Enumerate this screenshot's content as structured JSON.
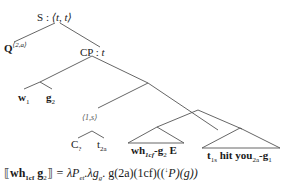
{
  "tree": {
    "root": {
      "cat": "S",
      "type": "⟨t, t⟩"
    },
    "q_node": {
      "label": "Q",
      "superscript": "⟨2,a⟩"
    },
    "cp_node": {
      "cat": "CP",
      "type": "t"
    },
    "wh_phrase": {
      "w": {
        "label": "w",
        "subscript": "1"
      },
      "g": {
        "label": "g",
        "subscript": "2"
      }
    },
    "index_node": {
      "label": "⟨1,s⟩"
    },
    "c_node": {
      "label": "C",
      "subscript": "?"
    },
    "trace_node": {
      "label": "t",
      "subscript": "2a"
    },
    "triangle_left": {
      "wh": "wh",
      "wh_sub": "1cf",
      "dash": "-",
      "g": "g",
      "g_sub": "2",
      "e": "E"
    },
    "triangle_right": {
      "t": "t",
      "t_sub": "1s",
      "verb": "hit",
      "you": "you",
      "you_sub": "2a",
      "dash": "-",
      "g": "g",
      "g_sub": "1"
    }
  },
  "formula": {
    "lbr": "⟦",
    "wh": "wh",
    "wh_sub": "1cf",
    "g": "g",
    "g_sub": "2",
    "rbr": "⟧",
    "rhs_1": " = λP",
    "p_sub": "et",
    "rhs_2": ".λg",
    "g2_sub": "g",
    "rhs_3": ". g(2a)(1cf)((",
    "arrow": "↓",
    "rhs_4": "P)(g))"
  }
}
